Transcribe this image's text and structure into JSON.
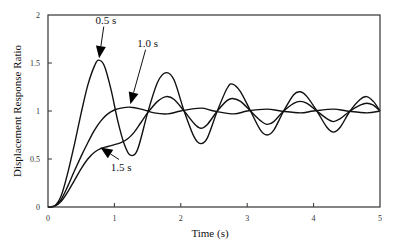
{
  "chart_data": {
    "type": "line",
    "title": "",
    "xlabel": "Time (s)",
    "ylabel": "Displacement Response Ratio",
    "xlim": [
      0,
      5
    ],
    "ylim": [
      0,
      2
    ],
    "xticks": [
      "0",
      "1",
      "2",
      "3",
      "4",
      "5"
    ],
    "yticks": [
      "0",
      "0.5",
      "1",
      "1.5",
      "2"
    ],
    "grid": false,
    "legend": "none (curves labeled by arrow annotations)",
    "series": [
      {
        "name": "0.5 s",
        "x": [
          0,
          0.1,
          0.2,
          0.3,
          0.4,
          0.5,
          0.6,
          0.7,
          0.76,
          0.85,
          0.95,
          1.05,
          1.15,
          1.24,
          1.35,
          1.5,
          1.65,
          1.78,
          1.9,
          2.05,
          2.2,
          2.3,
          2.4,
          2.55,
          2.7,
          2.78,
          2.9,
          3.05,
          3.2,
          3.3,
          3.4,
          3.55,
          3.7,
          3.8,
          3.9,
          4.05,
          4.2,
          4.3,
          4.4,
          4.55,
          4.7,
          4.8,
          4.9,
          5.0
        ],
        "y": [
          0,
          0.01,
          0.12,
          0.36,
          0.66,
          0.98,
          1.27,
          1.47,
          1.53,
          1.47,
          1.22,
          0.9,
          0.65,
          0.54,
          0.6,
          0.98,
          1.3,
          1.4,
          1.32,
          1.0,
          0.73,
          0.66,
          0.72,
          1.0,
          1.24,
          1.28,
          1.2,
          1.0,
          0.8,
          0.75,
          0.8,
          1.0,
          1.17,
          1.2,
          1.15,
          1.0,
          0.83,
          0.78,
          0.83,
          1.0,
          1.12,
          1.15,
          1.1,
          1.0
        ]
      },
      {
        "name": "1.0 s",
        "x": [
          0,
          0.1,
          0.2,
          0.3,
          0.4,
          0.5,
          0.6,
          0.7,
          0.8,
          0.9,
          1.0,
          1.1,
          1.25,
          1.4,
          1.6,
          1.8,
          2.0,
          2.3,
          2.5,
          2.8,
          3.0,
          3.3,
          3.5,
          3.8,
          4.0,
          4.3,
          4.5,
          4.8,
          5.0
        ],
        "y": [
          0,
          0.01,
          0.08,
          0.22,
          0.38,
          0.53,
          0.67,
          0.8,
          0.9,
          0.97,
          1.01,
          1.03,
          1.04,
          1.02,
          0.98,
          0.97,
          1.0,
          1.03,
          1.0,
          0.97,
          1.0,
          1.02,
          1.0,
          0.98,
          1.0,
          1.02,
          1.0,
          0.98,
          1.0
        ]
      },
      {
        "name": "1.5 s",
        "x": [
          0,
          0.1,
          0.2,
          0.3,
          0.4,
          0.5,
          0.6,
          0.7,
          0.8,
          0.9,
          1.0,
          1.1,
          1.2,
          1.3,
          1.4,
          1.5,
          1.65,
          1.78,
          1.9,
          2.05,
          2.2,
          2.3,
          2.4,
          2.55,
          2.7,
          2.78,
          2.9,
          3.05,
          3.2,
          3.3,
          3.4,
          3.55,
          3.7,
          3.8,
          3.9,
          4.05,
          4.2,
          4.3,
          4.4,
          4.55,
          4.7,
          4.8,
          4.9,
          5.0
        ],
        "y": [
          0,
          0.01,
          0.06,
          0.16,
          0.28,
          0.4,
          0.5,
          0.57,
          0.61,
          0.63,
          0.65,
          0.67,
          0.71,
          0.78,
          0.88,
          0.98,
          1.1,
          1.15,
          1.12,
          1.0,
          0.87,
          0.82,
          0.86,
          1.0,
          1.11,
          1.13,
          1.1,
          1.0,
          0.9,
          0.86,
          0.89,
          1.0,
          1.08,
          1.1,
          1.08,
          1.0,
          0.92,
          0.89,
          0.92,
          1.0,
          1.06,
          1.08,
          1.06,
          1.0
        ]
      }
    ],
    "annotations": [
      {
        "text": "0.5 s",
        "label_x": 0.87,
        "label_y": 1.91,
        "arrow_to": [
          0.77,
          1.55
        ]
      },
      {
        "text": "1.0 s",
        "label_x": 1.5,
        "label_y": 1.67,
        "arrow_to": [
          1.24,
          1.07
        ]
      },
      {
        "text": "1.5 s",
        "label_x": 1.1,
        "label_y": 0.38,
        "arrow_to": [
          0.79,
          0.62
        ]
      }
    ]
  }
}
